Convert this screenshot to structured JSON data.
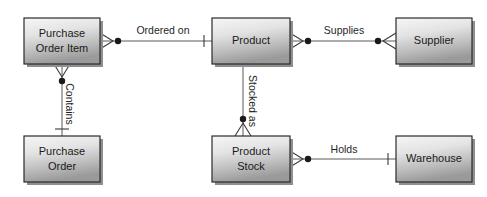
{
  "diagram": {
    "type": "entity-relationship-diagram",
    "notation": "crow's foot",
    "background_color": "#ffffff",
    "entity_fill_top": "#f2f2f2",
    "entity_fill_bottom": "#9d9d9d",
    "entity_border_color": "#2b2b2b",
    "line_color": "#5a5a5a",
    "entities": [
      {
        "id": "purchase-order-item",
        "label_line1": "Purchase",
        "label_line2": "Order Item",
        "x": 24,
        "y": 18,
        "width": 76,
        "height": 46
      },
      {
        "id": "purchase-order",
        "label_line1": "Purchase",
        "label_line2": "Order",
        "x": 24,
        "y": 136,
        "width": 76,
        "height": 46
      },
      {
        "id": "product",
        "label_line1": "Product",
        "label_line2": "",
        "x": 212,
        "y": 18,
        "width": 78,
        "height": 46
      },
      {
        "id": "product-stock",
        "label_line1": "Product",
        "label_line2": "Stock",
        "x": 212,
        "y": 136,
        "width": 78,
        "height": 46
      },
      {
        "id": "supplier",
        "label_line1": "Supplier",
        "label_line2": "",
        "x": 396,
        "y": 18,
        "width": 76,
        "height": 46
      },
      {
        "id": "warehouse",
        "label_line1": "Warehouse",
        "label_line2": "",
        "x": 396,
        "y": 136,
        "width": 76,
        "height": 46
      }
    ],
    "relationships": [
      {
        "id": "ordered-on",
        "label": "Ordered on",
        "from": "purchase-order-item",
        "to": "product",
        "from_cardinality": "zero-or-many",
        "to_cardinality": "one-and-only-one",
        "orientation": "horizontal",
        "label_x": 163,
        "label_y": 31
      },
      {
        "id": "supplies",
        "label": "Supplies",
        "from": "product",
        "to": "supplier",
        "from_cardinality": "zero-or-many",
        "to_cardinality": "zero-or-many",
        "orientation": "horizontal",
        "label_x": 344,
        "label_y": 31
      },
      {
        "id": "contains",
        "label": "Contains",
        "from": "purchase-order-item",
        "to": "purchase-order",
        "from_cardinality": "zero-or-many",
        "to_cardinality": "one-and-only-one",
        "orientation": "vertical",
        "label_x": 69,
        "label_y": 104
      },
      {
        "id": "stocked-as",
        "label": "Stocked as",
        "from": "product",
        "to": "product-stock",
        "from_cardinality": "plain",
        "to_cardinality": "zero-or-many",
        "orientation": "vertical",
        "label_x": 257,
        "label_y": 101
      },
      {
        "id": "holds",
        "label": "Holds",
        "from": "product-stock",
        "to": "warehouse",
        "from_cardinality": "zero-or-many",
        "to_cardinality": "one-and-only-one",
        "orientation": "horizontal",
        "label_x": 344,
        "label_y": 150
      }
    ]
  }
}
